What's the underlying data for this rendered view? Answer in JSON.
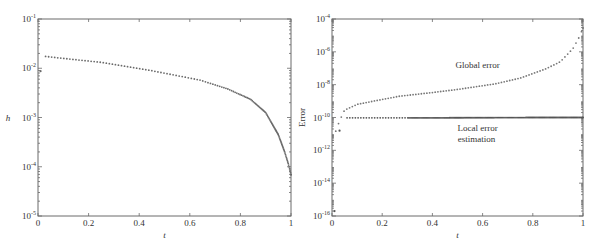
{
  "chart_data": [
    {
      "type": "scatter",
      "title": "",
      "xlabel": "t",
      "ylabel": "h",
      "yscale": "log",
      "xlim": [
        0,
        1
      ],
      "ylim_exp": [
        -5,
        -1
      ],
      "xticks": [
        "0",
        "0.2",
        "0.4",
        "0.6",
        "0.8",
        "1"
      ],
      "yticks": [
        {
          "base": "10",
          "exp": "-1"
        },
        {
          "base": "10",
          "exp": "-2"
        },
        {
          "base": "10",
          "exp": "-3"
        },
        {
          "base": "10",
          "exp": "-4"
        },
        {
          "base": "10",
          "exp": "-5"
        }
      ],
      "series": [
        {
          "name": "h",
          "marker": "dot",
          "color": "#6a6a6a",
          "points_log10": [
            [
              0.01,
              -2.06
            ],
            [
              0.03,
              -1.76
            ],
            [
              0.1,
              -1.8
            ],
            [
              0.25,
              -1.88
            ],
            [
              0.44,
              -2.04
            ],
            [
              0.64,
              -2.24
            ],
            [
              0.75,
              -2.42
            ],
            [
              0.84,
              -2.63
            ],
            [
              0.9,
              -2.9
            ],
            [
              0.95,
              -3.35
            ],
            [
              0.975,
              -3.7
            ],
            [
              0.99,
              -3.95
            ],
            [
              1.0,
              -4.16
            ]
          ]
        }
      ]
    },
    {
      "type": "scatter",
      "title": "",
      "xlabel": "t",
      "ylabel": "Error",
      "yscale": "log",
      "xlim": [
        0,
        1
      ],
      "ylim_exp": [
        -16,
        -4
      ],
      "xticks": [
        "0",
        "0.2",
        "0.4",
        "0.6",
        "0.8",
        "1"
      ],
      "yticks": [
        {
          "base": "10",
          "exp": "-4"
        },
        {
          "base": "10",
          "exp": "-6"
        },
        {
          "base": "10",
          "exp": "-8"
        },
        {
          "base": "10",
          "exp": "-10"
        },
        {
          "base": "10",
          "exp": "-12"
        },
        {
          "base": "10",
          "exp": "-14"
        },
        {
          "base": "10",
          "exp": "-16"
        }
      ],
      "annotations": [
        {
          "text": "Global error",
          "t": 0.6,
          "log10": -7.0
        },
        {
          "text_lines": [
            "Local error",
            "estimation"
          ],
          "t": 0.6,
          "log10": -10.8
        }
      ],
      "series": [
        {
          "name": "Global error",
          "marker": "dot",
          "color": "#777777",
          "points_log10": [
            [
              0.015,
              -10.83
            ],
            [
              0.03,
              -10.2
            ],
            [
              0.05,
              -9.55
            ],
            [
              0.1,
              -9.2
            ],
            [
              0.2,
              -8.9
            ],
            [
              0.27,
              -8.7
            ],
            [
              0.4,
              -8.48
            ],
            [
              0.51,
              -8.27
            ],
            [
              0.65,
              -7.95
            ],
            [
              0.75,
              -7.6
            ],
            [
              0.85,
              -7.05
            ],
            [
              0.91,
              -6.6
            ],
            [
              0.96,
              -5.8
            ],
            [
              0.985,
              -5.1
            ],
            [
              1.0,
              -4.55
            ]
          ]
        },
        {
          "name": "Local error estimation",
          "marker": "dot",
          "color": "#555555",
          "points_log10": [
            [
              0.01,
              -15.7
            ],
            [
              0.03,
              -10.8
            ],
            [
              0.06,
              -10.02
            ],
            [
              0.2,
              -10.02
            ],
            [
              0.4,
              -10.02
            ],
            [
              0.6,
              -10.01
            ],
            [
              0.8,
              -10.0
            ],
            [
              1.0,
              -10.0
            ]
          ]
        }
      ]
    }
  ]
}
